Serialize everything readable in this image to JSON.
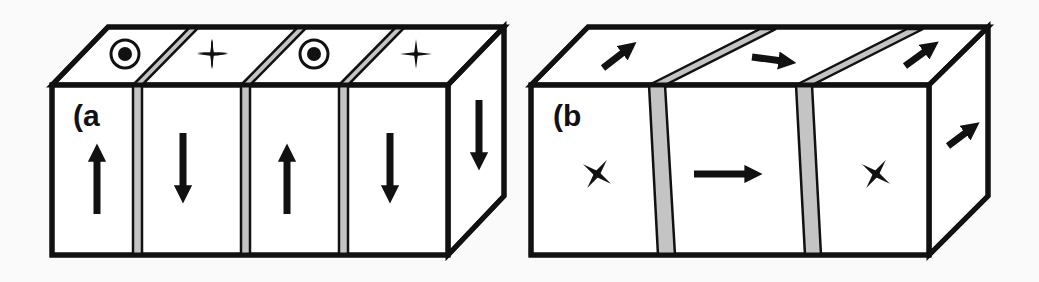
{
  "figure": {
    "panels": [
      {
        "id": "a",
        "label": "(a",
        "description": "Block with four stripe domains separated by domain walls; magnetization alternates up/down on the front face, top face shows out-of-plane (dot) and into-plane (cross) symbols.",
        "domains": [
          {
            "front_arrow": "up",
            "top_symbol": "circle-dot"
          },
          {
            "front_arrow": "down",
            "top_symbol": "cross"
          },
          {
            "front_arrow": "up",
            "top_symbol": "circle-dot"
          },
          {
            "front_arrow": "down",
            "top_symbol": "cross"
          }
        ],
        "side_face_arrow": "down",
        "domain_wall_count": 3
      },
      {
        "id": "b",
        "label": "(b",
        "description": "Block with three domains separated by slanted domain walls; arrows indicate in-plane magnetization directions.",
        "domains": [
          {
            "front_symbol": "cross",
            "top_arrow": "diagonal-up-right"
          },
          {
            "front_arrow": "right",
            "top_arrow": "right"
          },
          {
            "front_symbol": "cross",
            "top_arrow": "diagonal-up-right"
          }
        ],
        "side_face_arrow": "diagonal-up-right",
        "domain_wall_count": 2
      }
    ],
    "colors": {
      "line": "#111111",
      "face": "#ffffff",
      "wall": "#c4c4c4",
      "background": "#fafafa"
    }
  }
}
